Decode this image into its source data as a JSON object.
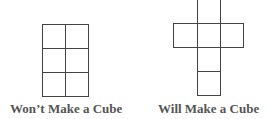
{
  "diagrams": [
    {
      "name": "non-cube-net",
      "label": "Won’t Make a Cube",
      "layout": "2x3 grid of squares"
    },
    {
      "name": "cube-net",
      "label": "Will Make a Cube",
      "layout": "cross of six squares"
    }
  ],
  "line_color": "#444444",
  "label_color": "#555555"
}
